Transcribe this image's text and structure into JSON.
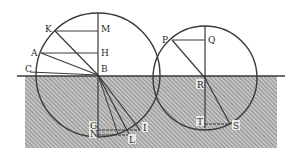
{
  "figure": {
    "colors": {
      "ink": "#3a3a3a",
      "hatch": "#6a6a6a",
      "water_bg": "#bdbdbd",
      "paper": "#ffffff"
    }
  },
  "labels": {
    "K": "K",
    "M": "M",
    "A": "A",
    "H": "H",
    "C": "C",
    "B": "B",
    "G": "G",
    "N": "N",
    "I": "I",
    "L": "L",
    "P": "P",
    "Q": "Q",
    "R": "R",
    "T": "T",
    "S": "S"
  }
}
